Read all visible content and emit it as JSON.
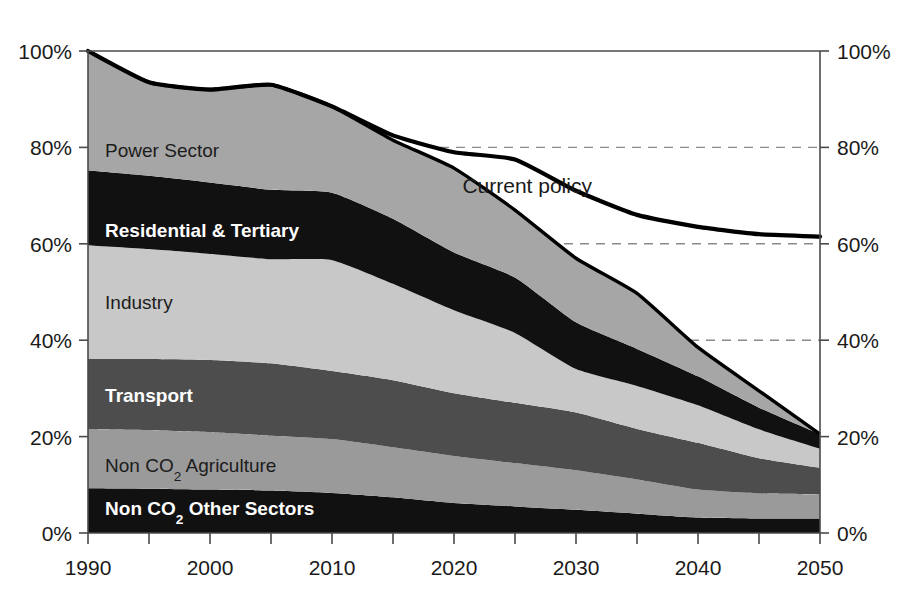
{
  "chart_data": {
    "type": "area",
    "stacked": true,
    "title": "",
    "xlabel": "",
    "ylabel": "",
    "xlim": [
      1990,
      2050
    ],
    "ylim": [
      0,
      100
    ],
    "grid": "dashed horizontal right-side at 40%, 60%, 80%",
    "legend_position": "inline-labels",
    "x": [
      1990,
      1995,
      2000,
      2005,
      2010,
      2015,
      2020,
      2025,
      2030,
      2035,
      2040,
      2045,
      2050
    ],
    "x_tick_labels": [
      "1990",
      "2000",
      "2010",
      "2020",
      "2030",
      "2040",
      "2050"
    ],
    "x_major_ticks": [
      1990,
      2000,
      2010,
      2020,
      2030,
      2040,
      2050
    ],
    "x_minor_ticks": [
      1995,
      2005,
      2015,
      2025,
      2035,
      2045
    ],
    "y_tick_labels": [
      "0%",
      "20%",
      "40%",
      "60%",
      "80%",
      "100%"
    ],
    "y_ticks": [
      0,
      20,
      40,
      60,
      80,
      100
    ],
    "series": [
      {
        "name": "Non CO2 Other Sectors",
        "color": "#111111",
        "label_style": "bold-light",
        "values": [
          9.3,
          9.2,
          9.0,
          8.8,
          8.3,
          7.4,
          6.2,
          5.5,
          4.8,
          4.0,
          3.2,
          3.0,
          3.0
        ]
      },
      {
        "name": "Non CO2 Agriculture",
        "color": "#9a9a9a",
        "label_style": "dark",
        "values": [
          12.2,
          12.1,
          11.9,
          11.4,
          11.2,
          10.4,
          9.8,
          9.0,
          8.2,
          7.1,
          5.8,
          5.2,
          5.0
        ]
      },
      {
        "name": "Transport",
        "color": "#4d4d4d",
        "label_style": "light",
        "values": [
          14.6,
          14.8,
          15.0,
          15.0,
          14.1,
          13.9,
          13.0,
          12.5,
          12.0,
          10.5,
          9.7,
          7.3,
          5.5
        ]
      },
      {
        "name": "Industry",
        "color": "#c8c8c8",
        "label_style": "dark",
        "values": [
          23.6,
          22.8,
          22.0,
          21.6,
          23.0,
          20.0,
          17.2,
          14.5,
          9.0,
          8.9,
          7.8,
          6.0,
          4.0
        ]
      },
      {
        "name": "Residential & Tertiary",
        "color": "#111111",
        "label_style": "bold-light",
        "values": [
          15.5,
          15.2,
          14.8,
          14.4,
          14.0,
          13.5,
          12.0,
          11.5,
          9.7,
          7.7,
          6.0,
          4.5,
          3.0
        ]
      },
      {
        "name": "Power Sector",
        "color": "#a6a6a6",
        "label_style": "dark",
        "values": [
          24.8,
          19.4,
          19.3,
          21.8,
          17.9,
          16.3,
          17.5,
          14.0,
          13.3,
          11.5,
          6.0,
          3.5,
          0.0
        ]
      }
    ],
    "stack_top": [
      100.0,
      93.5,
      92.0,
      93.0,
      88.5,
      81.5,
      75.7,
      67.0,
      57.0,
      49.7,
      38.5,
      29.5,
      20.5
    ],
    "annotation_line": {
      "name": "Current policy",
      "color": "#000000",
      "style": "solid-thick",
      "x": [
        1990,
        1995,
        2000,
        2005,
        2010,
        2015,
        2020,
        2025,
        2030,
        2035,
        2040,
        2045,
        2050
      ],
      "values": [
        100.0,
        93.5,
        92.0,
        93.0,
        88.5,
        82.5,
        79.0,
        77.5,
        71.0,
        66.0,
        63.5,
        62.0,
        61.5
      ]
    },
    "annotations": [
      {
        "text": "Current policy",
        "x": 2026,
        "y": 70.5
      }
    ],
    "series_inline_labels": [
      {
        "text": "Power Sector",
        "x": 1991.4,
        "y": 79.5,
        "style": "dark"
      },
      {
        "text": "Residential & Tertiary",
        "x": 1991.4,
        "y": 62.8,
        "style": "bold-light"
      },
      {
        "text": "Industry",
        "x": 1991.4,
        "y": 48.0,
        "style": "dark"
      },
      {
        "text": "Transport",
        "x": 1991.4,
        "y": 28.6,
        "style": "bold-light"
      },
      {
        "text": "Non CO2 Agriculture",
        "x": 1991.4,
        "y": 14.2,
        "style": "dark"
      },
      {
        "text": "Non CO2 Other Sectors",
        "x": 1991.4,
        "y": 5.2,
        "style": "bold-light"
      }
    ],
    "dashed_gridlines": [
      80,
      60,
      40
    ]
  },
  "axes": {
    "left_ticks": [
      "100%",
      "80%",
      "60%",
      "40%",
      "20%",
      "0%"
    ],
    "right_ticks": [
      "100%",
      "80%",
      "60%",
      "40%",
      "20%",
      "0%"
    ],
    "bottom_ticks": [
      "1990",
      "2000",
      "2010",
      "2020",
      "2030",
      "2040",
      "2050"
    ]
  }
}
